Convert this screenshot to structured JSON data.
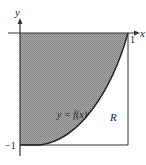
{
  "diagram": {
    "axis_labels": {
      "x": "x",
      "y": "y"
    },
    "tick_labels": {
      "x_one": "1",
      "y_neg_one": "−1"
    },
    "curve_label": "y = f(x)",
    "region_label": "R",
    "colors": {
      "shade": "#9a9a9a",
      "axis": "#333333",
      "curve": "#222222",
      "background": "#ffffff"
    }
  }
}
